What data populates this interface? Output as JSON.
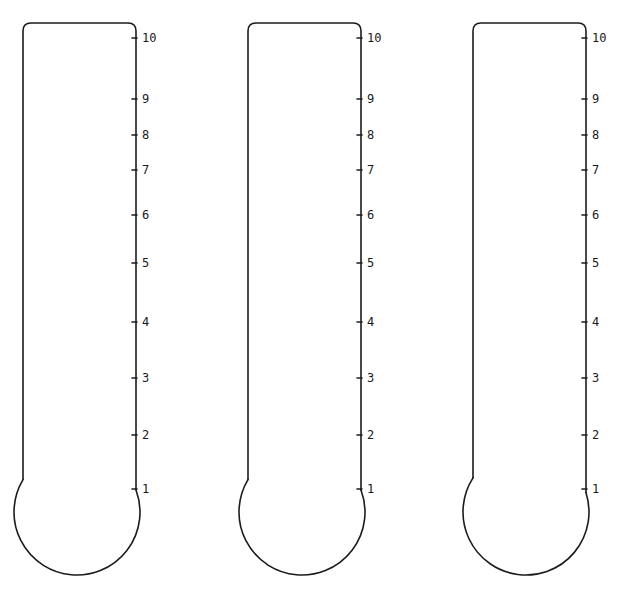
{
  "page": {
    "background": "#ffffff",
    "stroke_color": "#1c1c1c"
  },
  "scale": {
    "ticks": [
      {
        "label": "10",
        "y": 38
      },
      {
        "label": "9",
        "y": 99
      },
      {
        "label": "8",
        "y": 135
      },
      {
        "label": "7",
        "y": 170
      },
      {
        "label": "6",
        "y": 215
      },
      {
        "label": "5",
        "y": 263
      },
      {
        "label": "4",
        "y": 322
      },
      {
        "label": "3",
        "y": 378
      },
      {
        "label": "2",
        "y": 435
      },
      {
        "label": "1",
        "y": 489
      }
    ]
  },
  "thermometers": [
    {
      "id": "thermometer-1",
      "left": 23,
      "right": 136,
      "top": 23,
      "stem_bottom": 487,
      "bulb_cx": 77,
      "bulb_cy": 512,
      "bulb_r": 63,
      "fill_level": 0
    },
    {
      "id": "thermometer-2",
      "left": 248,
      "right": 361,
      "top": 23,
      "stem_bottom": 487,
      "bulb_cx": 302,
      "bulb_cy": 512,
      "bulb_r": 63,
      "fill_level": 0
    },
    {
      "id": "thermometer-3",
      "left": 473,
      "right": 586,
      "top": 23,
      "stem_bottom": 487,
      "bulb_cx": 526,
      "bulb_cy": 512,
      "bulb_r": 63,
      "fill_level": 0
    }
  ]
}
